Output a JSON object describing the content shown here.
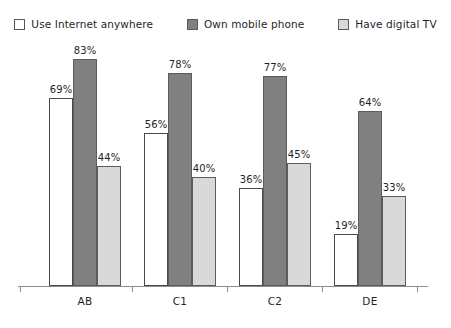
{
  "chart_data": {
    "type": "bar",
    "title": "",
    "subtitle": "",
    "xlabel": "",
    "ylabel": "",
    "ylim": [
      0,
      100
    ],
    "grid": false,
    "legend_position": "top-center",
    "value_labels": true,
    "value_suffix": "%",
    "categories": [
      "AB",
      "C1",
      "C2",
      "DE"
    ],
    "series": [
      {
        "name": "Use Internet anywhere",
        "color": "#ffffff",
        "values": [
          69,
          56,
          36,
          19
        ],
        "labels": [
          "69%",
          "56%",
          "36%",
          "19%"
        ]
      },
      {
        "name": "Own mobile phone",
        "color": "#808080",
        "values": [
          83,
          78,
          77,
          64
        ],
        "labels": [
          "83%",
          "78%",
          "77%",
          "64%"
        ]
      },
      {
        "name": "Have digital TV",
        "color": "#d9d9d9",
        "values": [
          44,
          40,
          45,
          33
        ],
        "labels": [
          "44%",
          "40%",
          "45%",
          "33%"
        ]
      }
    ]
  },
  "legend": {
    "items": [
      {
        "label": "Use Internet anywhere",
        "color": "#ffffff",
        "icon": "legend-swatch-icon"
      },
      {
        "label": "Own mobile phone",
        "color": "#808080",
        "icon": "legend-swatch-icon"
      },
      {
        "label": "Have digital TV",
        "color": "#d9d9d9",
        "icon": "legend-swatch-icon"
      }
    ]
  },
  "axis": {
    "categories": [
      "AB",
      "C1",
      "C2",
      "DE"
    ],
    "baseline_color": "#8c8c8c"
  }
}
